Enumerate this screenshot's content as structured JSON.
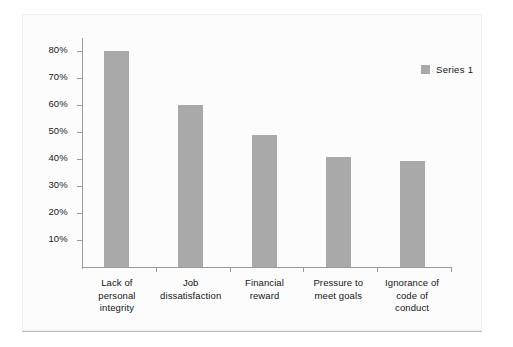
{
  "chart_data": {
    "type": "bar",
    "title": "",
    "subtitle": "",
    "xlabel": "",
    "ylabel": "",
    "grid": false,
    "legend_position": "top-right",
    "ylim": [
      0,
      85
    ],
    "ytick_labels": [
      "80%",
      "70%",
      "60%",
      "50%",
      "40%",
      "30%",
      "20%",
      "10%"
    ],
    "ytick_values": [
      80,
      70,
      60,
      50,
      40,
      30,
      20,
      10
    ],
    "categories": [
      "Lack of personal integrity",
      "Job dissatisfaction",
      "Financial reward",
      "Pressure to meet goals",
      "Ignorance of code of conduct"
    ],
    "category_label_lines": [
      [
        "Lack of",
        "personal",
        "integrity"
      ],
      [
        "Job",
        "dissatisfaction"
      ],
      [
        "Financial",
        "reward"
      ],
      [
        "Pressure to",
        "meet goals"
      ],
      [
        "Ignorance of",
        "code of",
        "conduct"
      ]
    ],
    "series": [
      {
        "name": "Series 1",
        "values": [
          80,
          60,
          49,
          41,
          39.5
        ]
      }
    ],
    "colors": {
      "bar": "#a9a9a9",
      "axis": "#9a9a9a",
      "text": "#151515",
      "panel_background": "#fcfcfc",
      "rule": "#b9b9b9"
    }
  },
  "legend": {
    "entries": [
      {
        "label": "Series 1",
        "swatch_color": "#a9a9a9"
      }
    ]
  }
}
